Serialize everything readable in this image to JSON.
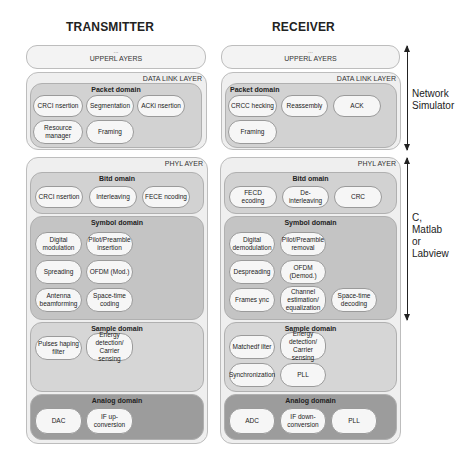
{
  "titles": {
    "transmitter": "TRANSMITTER",
    "receiver": "RECEIVER"
  },
  "transmitter": {
    "upper_layers": {
      "dots": "...",
      "label": "UPPERL AYERS"
    },
    "data_link_layer": {
      "label": "DATA LINK LAYER",
      "packet_domain": {
        "title": "Packet domain",
        "blocks": [
          "CRCI nsertion",
          "Segmentation",
          "ACKi nsertion",
          "Resource manager",
          "Framing"
        ]
      }
    },
    "phy_layer": {
      "label": "PHYL AYER",
      "bit_domain": {
        "title": "Bitd omain",
        "blocks": [
          "CRCI nsertion",
          "Interleaving",
          "FECE ncoding"
        ]
      },
      "symbol_domain": {
        "title": "Symbol domain",
        "blocks": [
          "Digital modulation",
          "Pilot/Preamble insertion",
          "Spreading",
          "OFDM (Mod.)",
          "Antenna beamforming",
          "Space-time coding"
        ]
      },
      "sample_domain": {
        "title": "Sample domain",
        "blocks": [
          "Pulses haping filter",
          "Energy detection/ Carrier sensing"
        ]
      },
      "analog_domain": {
        "title": "Analog domain",
        "blocks": [
          "DAC",
          "IF up-conversion"
        ]
      }
    }
  },
  "receiver": {
    "upper_layers": {
      "dots": "...",
      "label": "UPPERL AYERS"
    },
    "data_link_layer": {
      "label": "DATA LINK LAYER",
      "packet_domain": {
        "title": "Packet domain",
        "blocks": [
          "CRCC hecking",
          "Reassembly",
          "ACK",
          "Framing"
        ]
      }
    },
    "phy_layer": {
      "label": "PHYL AYER",
      "bit_domain": {
        "title": "Bitd omain",
        "blocks": [
          "FECD ecoding",
          "De-interleaving",
          "CRC"
        ]
      },
      "symbol_domain": {
        "title": "Symbol domain",
        "blocks": [
          "Digital demodulation",
          "Pilot/Preamble removal",
          "Despreading",
          "OFDM (Demod.)",
          "Frames ync",
          "Channel estimation/ equalization",
          "Space-time decoding"
        ]
      },
      "sample_domain": {
        "title": "Sample domain",
        "blocks": [
          "Matchedf ilter",
          "Energy detection/ Carrier sensing",
          "Synchronization",
          "PLL"
        ]
      },
      "analog_domain": {
        "title": "Analog domain",
        "blocks": [
          "ADC",
          "IF down-conversion",
          "PLL"
        ]
      }
    }
  },
  "side_labels": {
    "network_simulator": [
      "Network",
      "Simulator"
    ],
    "c_matlab_labview": [
      "C,",
      "Matlab",
      "or",
      "Labview"
    ]
  }
}
